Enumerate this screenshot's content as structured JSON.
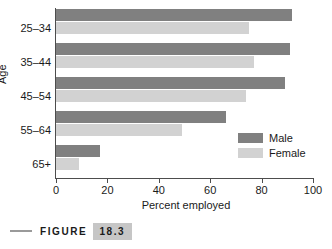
{
  "chart_data": {
    "type": "bar",
    "orientation": "horizontal",
    "title": "",
    "xlabel": "Percent employed",
    "ylabel": "Age",
    "categories": [
      "25–34",
      "35–44",
      "45–54",
      "55–64",
      "65+"
    ],
    "series": [
      {
        "name": "Male",
        "color": "#808080",
        "values": [
          92,
          91,
          89,
          66,
          17
        ]
      },
      {
        "name": "Female",
        "color": "#d2d2d2",
        "values": [
          75,
          77,
          74,
          49,
          9
        ]
      }
    ],
    "xlim": [
      0,
      100
    ],
    "xticks": [
      0,
      20,
      40,
      60,
      80,
      100
    ],
    "xtick_labels": [
      "0",
      "20",
      "40",
      "60",
      "80",
      "100"
    ],
    "grid": false,
    "legend_position": "center right"
  },
  "legend": {
    "entries": [
      {
        "label": "Male"
      },
      {
        "label": "Female"
      }
    ]
  },
  "caption": {
    "word": "FIGURE",
    "number": "18.3"
  }
}
